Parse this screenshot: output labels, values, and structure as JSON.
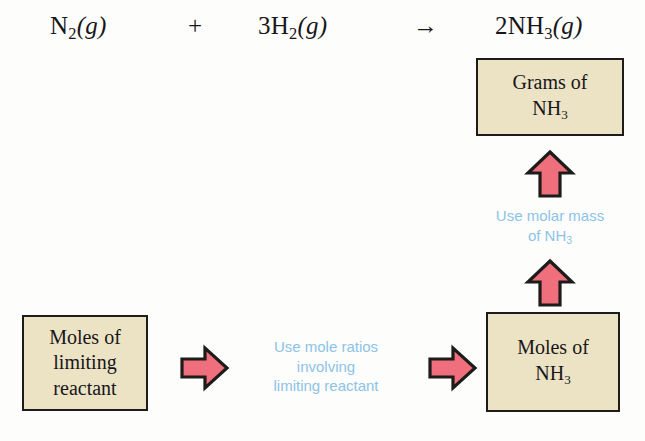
{
  "diagram": {
    "background_color": "#fdfdfb",
    "box_fill_color": "#ece3c4",
    "box_border_color": "#1d1c1a",
    "arrow_fill_color": "#ef6f7d",
    "arrow_border_color": "#1d1c1a",
    "note_color": "#8cc3e8",
    "text_color": "#17161a"
  },
  "equation": {
    "reactant1": {
      "coefficient": "",
      "formula": "N",
      "subscript": "2",
      "phase": "(g)"
    },
    "operator_plus": "+",
    "reactant2": {
      "coefficient": "3",
      "formula": "H",
      "subscript": "2",
      "phase": "(g)"
    },
    "operator_yields": "→",
    "product": {
      "coefficient": "2",
      "formula": "NH",
      "subscript": "3",
      "phase": "(g)"
    }
  },
  "boxes": [
    {
      "id": "grams-of-nh3",
      "line1": "Grams of",
      "line2": "NH",
      "subscript": "3"
    },
    {
      "id": "moles-of-limiting-reactant",
      "line1": "Moles of",
      "line2": "limiting",
      "line3": "reactant"
    },
    {
      "id": "moles-of-nh3",
      "line1": "Moles of",
      "line2": "NH",
      "subscript": "3"
    }
  ],
  "notes": [
    {
      "id": "use-molar-mass-of-nh3",
      "line1": "Use molar mass",
      "line2": "of NH",
      "subscript": "3"
    },
    {
      "id": "use-mole-ratios",
      "line1": "Use mole ratios",
      "line2": "involving",
      "line3": "limiting reactant"
    }
  ],
  "arrows": [
    {
      "id": "arrow-up-to-grams",
      "direction": "up"
    },
    {
      "id": "arrow-up-from-moles-nh3",
      "direction": "up"
    },
    {
      "id": "arrow-right-from-limiting-reactant",
      "direction": "right"
    },
    {
      "id": "arrow-right-to-moles-nh3",
      "direction": "right"
    }
  ]
}
